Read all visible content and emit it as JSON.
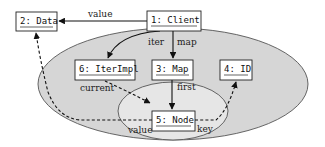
{
  "diagram": {
    "type": "object-graph",
    "regions": {
      "outer": {
        "fill": "#d6d6d6",
        "cx": 173,
        "cy": 84,
        "rx": 135,
        "ry": 56
      },
      "inner": {
        "fill": "#e6e6e6",
        "cx": 173,
        "cy": 111,
        "rx": 55,
        "ry": 29
      }
    },
    "nodes": [
      {
        "id": "1",
        "label": "1: Client",
        "x": 147,
        "y": 11,
        "w": 54,
        "h": 20
      },
      {
        "id": "2",
        "label": "2: Data",
        "x": 16,
        "y": 12,
        "w": 41,
        "h": 19
      },
      {
        "id": "3",
        "label": "3: Map",
        "x": 152,
        "y": 60,
        "w": 41,
        "h": 20
      },
      {
        "id": "4",
        "label": "4: ID",
        "x": 220,
        "y": 60,
        "w": 32,
        "h": 20
      },
      {
        "id": "5",
        "label": "5: Node",
        "x": 152,
        "y": 111,
        "w": 43,
        "h": 20
      },
      {
        "id": "6",
        "label": "6: IterImpl",
        "x": 75,
        "y": 60,
        "w": 60,
        "h": 20
      }
    ],
    "edges": [
      {
        "from": "1",
        "to": "2",
        "label": "value",
        "style": "solid"
      },
      {
        "from": "1",
        "to": "6",
        "label": "iter",
        "style": "solid"
      },
      {
        "from": "1",
        "to": "3",
        "label": "map",
        "style": "solid"
      },
      {
        "from": "3",
        "to": "5",
        "label": "first",
        "style": "solid"
      },
      {
        "from": "6",
        "to": "5",
        "label": "current",
        "style": "dashed"
      },
      {
        "from": "5",
        "to": "2",
        "label": "value",
        "style": "dashed"
      },
      {
        "from": "5",
        "to": "4",
        "label": "key",
        "style": "dashed"
      }
    ]
  },
  "labels": {
    "node1": "1: Client",
    "node2": "2: Data",
    "node3": "3: Map",
    "node4": "4: ID",
    "node5": "5: Node",
    "node6": "6: IterImpl",
    "edge_value_top": "value",
    "edge_iter": "iter",
    "edge_map": "map",
    "edge_first": "first",
    "edge_current": "current",
    "edge_value_bottom": "value",
    "edge_key": "key"
  },
  "colors": {
    "outer_region": "#d6d6d6",
    "inner_region": "#e6e6e6",
    "stroke": "#111111",
    "box_fill": "#ffffff"
  }
}
